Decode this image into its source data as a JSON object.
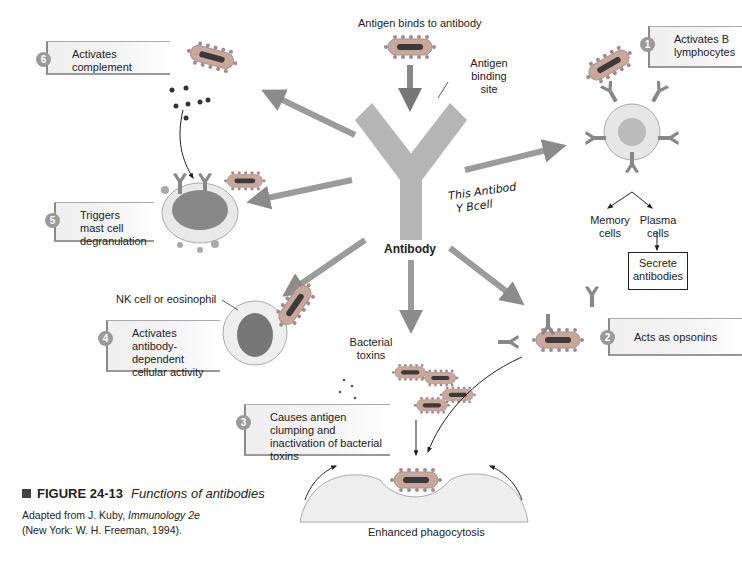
{
  "figure": {
    "number": "FIGURE 24-13",
    "title": "Functions of antibodies",
    "source_line1_prefix": "Adapted from J. Kuby, ",
    "source_line1_italic": "Immunology 2e",
    "source_line2": "(New York: W. H. Freeman, 1994)."
  },
  "center": {
    "top_label": "Antigen binds to antibody",
    "binding_site_label": "Antigen binding site",
    "antibody_label": "Antibody",
    "handwritten_note_line1": "This Antibod",
    "handwritten_note_line2": "Y Bcell"
  },
  "functions": [
    {
      "number": "1",
      "label": "Activates B lymphocytes"
    },
    {
      "number": "2",
      "label": "Acts as opsonins"
    },
    {
      "number": "3",
      "label": "Causes antigen clumping and inactivation of bacterial toxins"
    },
    {
      "number": "4",
      "label": "Activates antibody-dependent cellular activity"
    },
    {
      "number": "5",
      "label": "Triggers mast cell degranulation"
    },
    {
      "number": "6",
      "label": "Activates complement"
    }
  ],
  "annotations": {
    "memory_cells": "Memory cells",
    "plasma_cells": "Plasma cells",
    "secrete_antibodies": "Secrete antibodies",
    "nk_cell": "NK cell or eosinophil",
    "bacterial_toxins": "Bacterial toxins",
    "enhanced_phagocytosis": "Enhanced phagocytosis"
  },
  "colors": {
    "antibody_gray": "#b5b5b5",
    "bacterium_fill": "#c9a89a",
    "bacterium_core": "#3a3a3a",
    "arrow_gray": "#8a8a8a",
    "label_box_bg": "#efefef",
    "number_circle": "#9a9a9a"
  }
}
